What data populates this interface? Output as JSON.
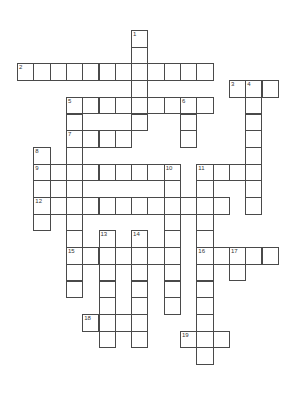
{
  "puzzle": {
    "type": "crossword",
    "grid": {
      "cols": 17,
      "rows": 20,
      "origin_x": 17,
      "origin_y": 30,
      "cell_w": 16.3,
      "cell_h": 16.7
    },
    "border_color": "#4a4a4a",
    "entries": [
      {
        "number": "1",
        "direction": "down",
        "col": 7,
        "row": 0,
        "length": 6
      },
      {
        "number": "2",
        "direction": "across",
        "col": 0,
        "row": 2,
        "length": 12
      },
      {
        "number": "3",
        "direction": "across",
        "col": 13,
        "row": 3,
        "length": 3
      },
      {
        "number": "4",
        "direction": "down",
        "col": 14,
        "row": 3,
        "length": 8
      },
      {
        "number": "5",
        "direction": "across",
        "col": 3,
        "row": 4,
        "length": 9
      },
      {
        "number": "5",
        "direction": "down",
        "col": 3,
        "row": 4,
        "length": 12
      },
      {
        "number": "6",
        "direction": "down",
        "col": 10,
        "row": 4,
        "length": 3
      },
      {
        "number": "7",
        "direction": "across",
        "col": 3,
        "row": 6,
        "length": 4
      },
      {
        "number": "8",
        "direction": "down",
        "col": 1,
        "row": 7,
        "length": 5
      },
      {
        "number": "9",
        "direction": "across",
        "col": 1,
        "row": 8,
        "length": 9
      },
      {
        "number": "",
        "direction": "down",
        "col": 2,
        "row": 8,
        "length": 3
      },
      {
        "number": "10",
        "direction": "down",
        "col": 9,
        "row": 8,
        "length": 9
      },
      {
        "number": "11",
        "direction": "across",
        "col": 11,
        "row": 8,
        "length": 4
      },
      {
        "number": "11",
        "direction": "down",
        "col": 11,
        "row": 8,
        "length": 12
      },
      {
        "number": "12",
        "direction": "across",
        "col": 1,
        "row": 10,
        "length": 12
      },
      {
        "number": "13",
        "direction": "down",
        "col": 5,
        "row": 12,
        "length": 7
      },
      {
        "number": "14",
        "direction": "down",
        "col": 7,
        "row": 12,
        "length": 7
      },
      {
        "number": "15",
        "direction": "across",
        "col": 3,
        "row": 13,
        "length": 7
      },
      {
        "number": "16",
        "direction": "across",
        "col": 11,
        "row": 13,
        "length": 5
      },
      {
        "number": "17",
        "direction": "down",
        "col": 13,
        "row": 13,
        "length": 2
      },
      {
        "number": "18",
        "direction": "across",
        "col": 4,
        "row": 17,
        "length": 4
      },
      {
        "number": "19",
        "direction": "across",
        "col": 10,
        "row": 18,
        "length": 3
      }
    ]
  }
}
